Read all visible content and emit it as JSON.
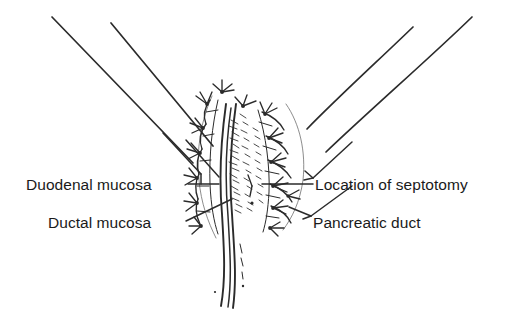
{
  "figure": {
    "background_color": "#ffffff",
    "ink_color": "#2b2b2b",
    "text_color": "#1a1a1a",
    "width": 527,
    "height": 329
  },
  "labels": {
    "duodenal_mucosa": "Duodenal mucosa",
    "ductal_mucosa": "Ductal mucosa",
    "location_of_septotomy": "Location of septotomy",
    "pancreatic_duct": "Pancreatic duct"
  },
  "structures": {
    "duodenal_wall": "duodenal-wall",
    "papilla": "papilla",
    "sutures": "interrupted-sutures",
    "duct_lumen": "duct-lumen",
    "septum": "septum"
  }
}
